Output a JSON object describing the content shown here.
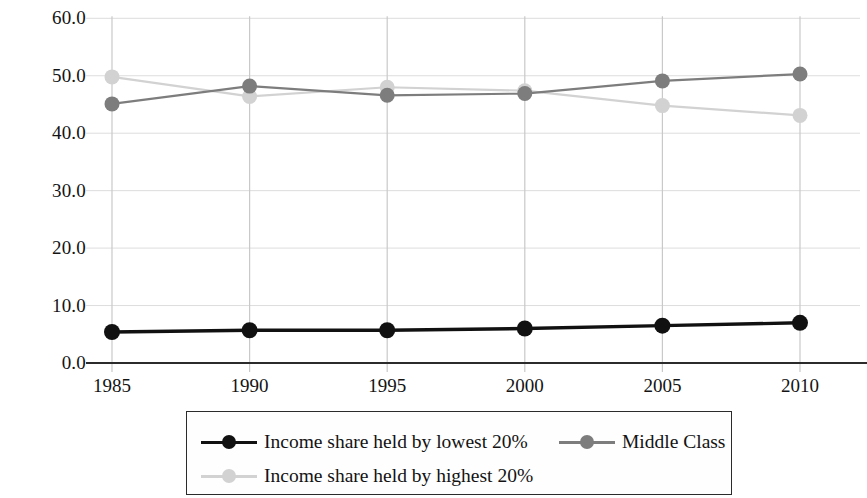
{
  "chart_data": {
    "type": "line",
    "title": "",
    "subtitle": "",
    "xlabel": "",
    "ylabel": "",
    "x": [
      1985,
      1990,
      1995,
      2000,
      2005,
      2010
    ],
    "categories": [
      "1985",
      "1990",
      "1995",
      "2000",
      "2005",
      "2010"
    ],
    "ylim": [
      0.0,
      60.0
    ],
    "yticks": [
      0.0,
      10.0,
      20.0,
      30.0,
      40.0,
      50.0,
      60.0
    ],
    "ytick_labels": [
      "0.0",
      "10.0",
      "20.0",
      "30.0",
      "40.0",
      "50.0",
      "60.0"
    ],
    "xtick_labels": [
      "1985",
      "1990",
      "1995",
      "2000",
      "2005",
      "2010"
    ],
    "grid": true,
    "grid_axis": "y",
    "legend_position": "bottom",
    "series": [
      {
        "name": "Income share held by lowest 20%",
        "color": "#111111",
        "marker": "circle",
        "values": [
          5.4,
          5.7,
          5.7,
          6.0,
          6.5,
          7.0
        ]
      },
      {
        "name": "Income share held by highest 20%",
        "color": "#d2d2d2",
        "marker": "circle",
        "values": [
          49.8,
          46.4,
          48.0,
          47.4,
          44.8,
          43.1
        ]
      },
      {
        "name": "Middle Class",
        "color": "#7d7d7d",
        "marker": "circle",
        "values": [
          45.1,
          48.2,
          46.6,
          46.9,
          49.1,
          50.3
        ]
      }
    ]
  },
  "legend": {
    "entries": [
      {
        "label": "Income share held by lowest 20%",
        "color": "#111111"
      },
      {
        "label": "Middle Class",
        "color": "#7d7d7d"
      },
      {
        "label": "Income share held by highest 20%",
        "color": "#d2d2d2"
      }
    ]
  },
  "colors": {
    "axis": "#2b2b2b",
    "grid": "#dddddd",
    "vertical_grid": "#c9c9c9",
    "background": "#ffffff",
    "lowest20": "#111111",
    "middle_class": "#7d7d7d",
    "highest20": "#d2d2d2"
  }
}
